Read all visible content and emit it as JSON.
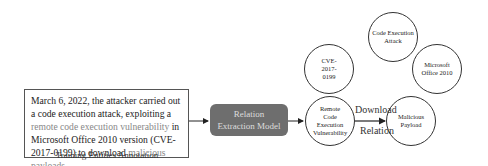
{
  "input_text": {
    "part1": "March 6, 2022, the attacker carried out a code execution attack, exploiting a ",
    "part2": "remote code execution vulnerability",
    "part3": " in Microsoft Office 2010 version (CVE-2017-0199) to download ",
    "part4": "malicious payloads",
    "part5": "."
  },
  "caption": "Training Entities Annotation",
  "model": {
    "line1": "Relation",
    "line2": "Extraction Model"
  },
  "nodes": [
    {
      "label": "Code Execution Attack"
    },
    {
      "label": "CVE-2017-0199"
    },
    {
      "label": "Microsoft Office 2010"
    },
    {
      "label": "Remote Code Execution Vulnerability"
    },
    {
      "label": "Malicious Payload"
    }
  ],
  "edge": {
    "top_label": "Download",
    "bottom_label": "Relation"
  },
  "colors": {
    "model_bg": "#6e6e6e",
    "highlight": "#888888"
  }
}
